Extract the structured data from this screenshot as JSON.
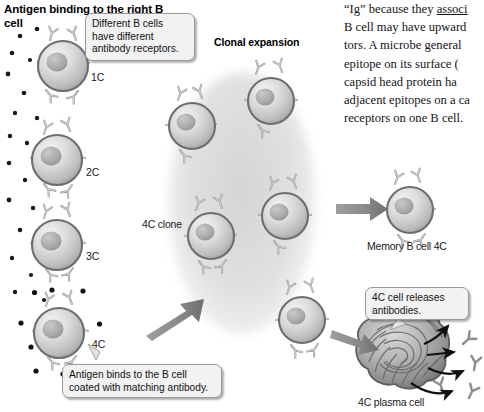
{
  "figure": {
    "title": "Antigen binding to the right B cell",
    "section_heading": "Clonal expansion",
    "clone_label": "4C clone",
    "memory_label": "Memory B cell 4C",
    "plasma_label": "4C plasma cell",
    "cell_labels": [
      "1C",
      "2C",
      "3C",
      "4C"
    ],
    "callouts": {
      "receptors": "Different B cells have different antibody receptors.",
      "binding": "Antigen binds to the B cell coated with matching antibody.",
      "release": "4C cell releases antibodies."
    },
    "prose": {
      "line1_pre": "“Ig” because they ",
      "line1_underline": "associ",
      "line2": "B cell may have upward",
      "line3": "tors. A microbe general",
      "line4": "epitope on its surface (",
      "line5": "capsid head protein ha",
      "line6": "adjacent epitopes on a ca",
      "line7": "receptors on one B cell."
    },
    "colors": {
      "cell_membrane": "#6e6e6e",
      "cell_fill": "#d2d2d2",
      "nucleus": "#a9a9a9",
      "receptor": "#9b9b9b",
      "antigen_dot": "#1a1a1a",
      "big_arrow": "#8a8a8a",
      "thin_arrow": "#1a1a1a",
      "halo": "#b4b4b4",
      "callout_bg": "#f2f2f2"
    }
  }
}
